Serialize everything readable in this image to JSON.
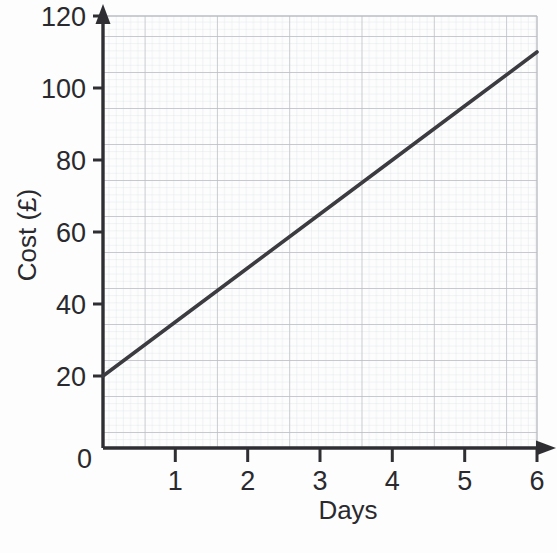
{
  "chart_data": {
    "type": "line",
    "title": "",
    "xlabel": "Days",
    "ylabel": "Cost (£)",
    "xlim": [
      0,
      6
    ],
    "ylim": [
      0,
      120
    ],
    "x_ticks": [
      "0",
      "1",
      "2",
      "3",
      "4",
      "5",
      "6"
    ],
    "x_tick_values": [
      0,
      1,
      2,
      3,
      4,
      5,
      6
    ],
    "y_ticks": [
      "0",
      "20",
      "40",
      "60",
      "80",
      "100",
      "120"
    ],
    "y_tick_values": [
      0,
      20,
      40,
      60,
      80,
      100,
      120
    ],
    "grid": true,
    "grid_major_step_x": 1,
    "grid_major_step_y": 20,
    "grid_minor_divisions": 5,
    "legend": "none",
    "series": [
      {
        "name": "Cost",
        "x": [
          0,
          1,
          2,
          3,
          4,
          5,
          6
        ],
        "values": [
          20,
          35,
          50,
          65,
          80,
          95,
          110
        ],
        "intercept": 20,
        "gradient": 15,
        "color": "#3b3b40"
      }
    ]
  },
  "axis_labels": {
    "y_title": "Cost (£)",
    "x_title": "Days",
    "y_0": "0",
    "y_20": "20",
    "y_40": "40",
    "y_60": "60",
    "y_80": "80",
    "y_100": "100",
    "y_120": "120",
    "x_0": "0",
    "x_1": "1",
    "x_2": "2",
    "x_3": "3",
    "x_4": "4",
    "x_5": "5",
    "x_6": "6"
  },
  "colors": {
    "line": "#3b3b40",
    "axis": "#2f2f33",
    "grid_major": "#b9bcc2",
    "grid_minor": "#dfe2e6",
    "background": "#fdfdfd",
    "text": "#2a2a2e"
  }
}
